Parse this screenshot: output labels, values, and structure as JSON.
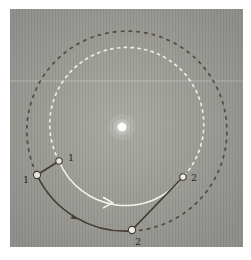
{
  "figure": {
    "type": "orbital-motion-diagram",
    "orbits": [
      {
        "name": "inner-orbit",
        "style": "dashed",
        "color": "#ededE6"
      },
      {
        "name": "outer-orbit",
        "style": "dashed",
        "color": "#5a4c44"
      }
    ],
    "sun": {
      "name": "sun-dot",
      "color": "#fcfcf8"
    },
    "points": [
      {
        "id": "outer-position-1",
        "label": "1"
      },
      {
        "id": "inner-position-1",
        "label": "1"
      },
      {
        "id": "inner-position-2",
        "label": "2"
      },
      {
        "id": "outer-position-2",
        "label": "2"
      }
    ],
    "motion_arcs": [
      {
        "name": "inner-travel-arc",
        "from": "1",
        "to": "2",
        "color": "#f4f4ee"
      },
      {
        "name": "outer-travel-arc",
        "from": "1",
        "to": "2",
        "color": "#463b34"
      }
    ],
    "colors": {
      "panel_background": "#9c9c97",
      "sight_line": "#463b34",
      "planet_dot_fill": "#e4e4de",
      "planet_dot_ring": "#433a33",
      "label_text": "#2a2521",
      "page_background": "#ffffff"
    }
  }
}
